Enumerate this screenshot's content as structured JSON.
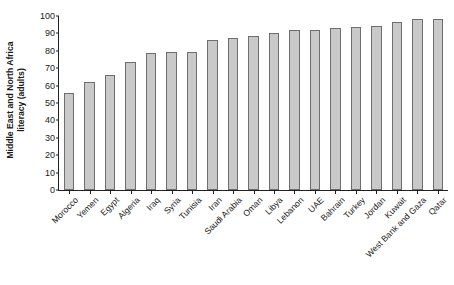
{
  "chart_data": {
    "type": "bar",
    "title": "",
    "subtitle": "",
    "xlabel": "",
    "ylabel": "Middle East and North Africa literacy (adults)",
    "ylabel_lines": [
      "Middle East and North Africa",
      "literacy (adults)"
    ],
    "ylim": [
      0,
      100
    ],
    "ytick_step": 10,
    "yticks": [
      0,
      10,
      20,
      30,
      40,
      50,
      60,
      70,
      80,
      90,
      100
    ],
    "ytick_labels": [
      "0",
      "10",
      "20",
      "30",
      "40",
      "50",
      "60",
      "70",
      "80",
      "90",
      "100"
    ],
    "grid": false,
    "legend": null,
    "legend_position": "none",
    "bar_color": "#c9c9c9",
    "bar_border_color": "#6e6e6e",
    "axis_color": "#231f20",
    "background_color": "#ffffff",
    "xtick_label_rotation": -45,
    "categories": [
      "Morocco",
      "Yemen",
      "Egypt",
      "Algeria",
      "Iraq",
      "Syria",
      "Tunisia",
      "Iran",
      "Saudi Arabia",
      "Oman",
      "Libya",
      "Lebanon",
      "UAE",
      "Bahrain",
      "Turkey",
      "Jordan",
      "Kuwait",
      "West Bank and Gaza",
      "Qatar"
    ],
    "values": [
      56.0,
      62.0,
      66.0,
      73.5,
      79.0,
      79.5,
      79.5,
      86.0,
      87.5,
      88.5,
      90.5,
      92.0,
      92.0,
      93.0,
      93.5,
      94.5,
      96.5,
      98.0,
      98.0
    ]
  }
}
